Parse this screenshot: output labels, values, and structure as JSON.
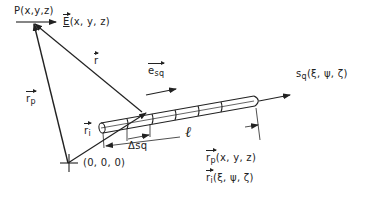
{
  "diagram": {
    "type": "vector-geometry figure",
    "point_p_label": "P(x,y,z)",
    "field_label": {
      "symbol": "E",
      "args": "(x, y, z)"
    },
    "vector_r_label": "r",
    "vector_rp_label": {
      "symbol": "r",
      "sub": "p"
    },
    "vector_ri_label": {
      "symbol": "r",
      "sub": "i"
    },
    "unit_vector_label": {
      "symbol": "e",
      "sub": "sq"
    },
    "source_label": {
      "symbol": "s",
      "sub": "q",
      "args": "(ξ, ψ, ζ)"
    },
    "segment_label": "Δsq",
    "length_label": "ℓ",
    "origin_label": "(0, 0, 0)",
    "legend": [
      {
        "symbol": "r",
        "sub": "p",
        "args": "(x, y, z)"
      },
      {
        "symbol": "r",
        "sub": "i",
        "args": "(ξ, ψ, ζ)"
      }
    ]
  }
}
